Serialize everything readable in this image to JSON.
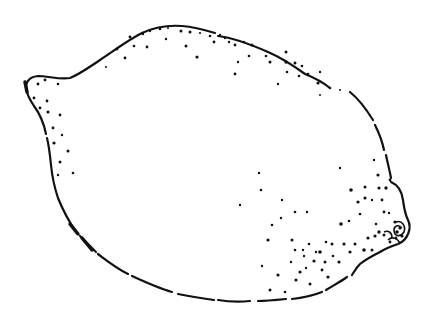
{
  "image": {
    "subject": "lemon line drawing",
    "caption": "Lemon",
    "colors": {
      "ink": "#111111",
      "background": "#ffffff"
    }
  }
}
